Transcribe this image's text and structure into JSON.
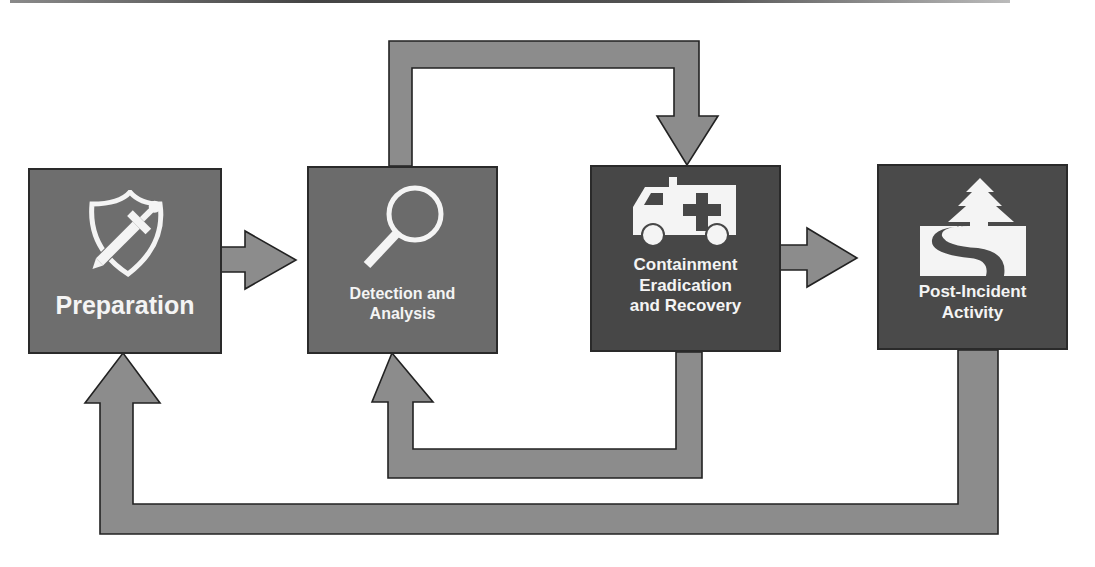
{
  "diagram": {
    "nodes": [
      {
        "id": "preparation",
        "label": "Preparation",
        "icon": "shield-sword-icon"
      },
      {
        "id": "detection",
        "label_line1": "Detection and",
        "label_line2": "Analysis",
        "icon": "magnifying-glass-icon"
      },
      {
        "id": "containment",
        "label_line1": "Containment",
        "label_line2": "Eradication",
        "label_line3": "and Recovery",
        "icon": "ambulance-icon"
      },
      {
        "id": "post_incident",
        "label_line1": "Post-Incident",
        "label_line2": "Activity",
        "icon": "tree-river-icon"
      }
    ],
    "edges": [
      {
        "from": "preparation",
        "to": "detection"
      },
      {
        "from": "detection",
        "to": "containment",
        "route": "over-top"
      },
      {
        "from": "containment",
        "to": "detection",
        "route": "under-bottom"
      },
      {
        "from": "containment",
        "to": "post_incident"
      },
      {
        "from": "post_incident",
        "to": "preparation",
        "route": "under-bottom"
      }
    ],
    "colors": {
      "arrow_fill": "#8c8c8c",
      "arrow_stroke": "#222222",
      "box_light": "#6e6e6e",
      "box_dark": "#474747",
      "text": "#f4f4f4"
    }
  }
}
